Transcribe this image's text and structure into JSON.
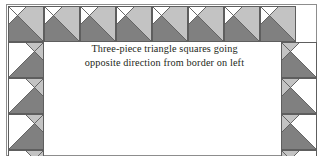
{
  "figure": {
    "name": "quilt-border-corner-diagram",
    "background_color": "#ffffff",
    "frame_line_color": "#8d8d8d"
  },
  "caption": {
    "line1": "Three-piece triangle squares going",
    "line2": "opposite direction from border on left",
    "text_color": "#231f20"
  },
  "palette": {
    "dark_gray": "#808080",
    "light_gray": "#c3c3c3",
    "white": "#ffffff",
    "seam_line": "#5e5e5e"
  },
  "legend": {
    "dark_piece": "dark gray triangle",
    "light_piece": "light gray triangle",
    "background_piece": "white triangle"
  },
  "quilt": {
    "unit_size_px": 36,
    "top_row": {
      "name": "top-border-row",
      "count": 8,
      "orientation": "dark-triangle-lower-left, light-triangle-upper-right, white-triangle-upper-left",
      "units": [
        {
          "index": 1,
          "dark": "#808080",
          "light": "#c3c3c3",
          "blank": "#ffffff"
        },
        {
          "index": 2,
          "dark": "#808080",
          "light": "#c3c3c3",
          "blank": "#ffffff"
        },
        {
          "index": 3,
          "dark": "#808080",
          "light": "#c3c3c3",
          "blank": "#ffffff"
        },
        {
          "index": 4,
          "dark": "#808080",
          "light": "#c3c3c3",
          "blank": "#ffffff"
        },
        {
          "index": 5,
          "dark": "#808080",
          "light": "#c3c3c3",
          "blank": "#ffffff"
        },
        {
          "index": 6,
          "dark": "#808080",
          "light": "#c3c3c3",
          "blank": "#ffffff"
        },
        {
          "index": 7,
          "dark": "#808080",
          "light": "#c3c3c3",
          "blank": "#ffffff"
        },
        {
          "index": 8,
          "dark": "#808080",
          "light": "#c3c3c3",
          "blank": "#ffffff"
        }
      ]
    },
    "left_column": {
      "name": "left-border-column",
      "count": 4,
      "orientation": "dark-triangle-lower-right, light-triangle-upper-right, white-triangle-left",
      "units": [
        {
          "index": 1,
          "dark": "#808080",
          "light": "#c3c3c3",
          "blank": "#ffffff"
        },
        {
          "index": 2,
          "dark": "#808080",
          "light": "#c3c3c3",
          "blank": "#ffffff"
        },
        {
          "index": 3,
          "dark": "#808080",
          "light": "#c3c3c3",
          "blank": "#ffffff"
        },
        {
          "index": 4,
          "dark": "#808080",
          "light": "#c3c3c3",
          "blank": "#ffffff"
        }
      ]
    },
    "right_column": {
      "name": "right-border-column",
      "count": 4,
      "orientation": "dark-triangle-lower-left, light-triangle-upper-left, white-triangle-right",
      "units": [
        {
          "index": 1,
          "dark": "#808080",
          "light": "#c3c3c3",
          "blank": "#ffffff"
        },
        {
          "index": 2,
          "dark": "#808080",
          "light": "#c3c3c3",
          "blank": "#ffffff"
        },
        {
          "index": 3,
          "dark": "#808080",
          "light": "#c3c3c3",
          "blank": "#ffffff"
        },
        {
          "index": 4,
          "dark": "#808080",
          "light": "#c3c3c3",
          "blank": "#ffffff"
        }
      ]
    }
  }
}
